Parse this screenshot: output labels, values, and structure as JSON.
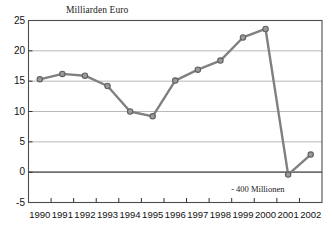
{
  "chart_data": {
    "type": "line",
    "title": "Milliarden Euro",
    "xlabel": "",
    "ylabel": "Milliarden Euro",
    "categories": [
      "1990",
      "1991",
      "1992",
      "1993",
      "1994",
      "1995",
      "1996",
      "1997",
      "1998",
      "1999",
      "2000",
      "2001",
      "2002"
    ],
    "values": [
      15.3,
      16.2,
      15.9,
      14.2,
      10.0,
      9.2,
      15.1,
      16.9,
      18.4,
      22.2,
      23.6,
      -0.4,
      2.9
    ],
    "ylim": [
      -5,
      25
    ],
    "yticks": [
      25,
      20,
      15,
      10,
      5,
      0,
      -5
    ],
    "ytick_labels": [
      "25",
      "20",
      "15",
      "10",
      "5",
      "0",
      "-5"
    ],
    "grid": true,
    "legend": "none",
    "series_color": "#808080",
    "marker_color": "#9a9a9a",
    "marker_edge_color": "#606060",
    "gridline_color": "#b0b0b0",
    "zero_line_color": "#707070",
    "axis_color": "#4d4d4d",
    "annotations": [
      {
        "text": "- 400 Millionen",
        "x_category": "2001",
        "y_value": -0.4
      }
    ]
  }
}
